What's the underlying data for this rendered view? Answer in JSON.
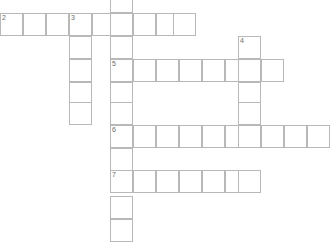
{
  "puzzle": {
    "title": "Crossword Grid",
    "cell_size": 23,
    "grid_columns": 14,
    "grid_rows": 11,
    "line_color": "#b8b8b8",
    "cell_color": "#ffffff",
    "number_color": "#6b6b6b",
    "background_color": "#ffffff"
  },
  "numbers_visible": [
    "2",
    "3",
    "4",
    "5",
    "6",
    "7"
  ],
  "cells": [
    {
      "id": "c-r0-c5",
      "x": 110,
      "y": -10,
      "number": "",
      "letter": ""
    },
    {
      "id": "c-r1-c0",
      "x": 0,
      "y": 13,
      "number": "2",
      "letter": ""
    },
    {
      "id": "c-r1-c1",
      "x": 23,
      "y": 13,
      "number": "",
      "letter": ""
    },
    {
      "id": "c-r1-c2",
      "x": 46,
      "y": 13,
      "number": "",
      "letter": ""
    },
    {
      "id": "c-r1-c3",
      "x": 69,
      "y": 13,
      "number": "3",
      "letter": ""
    },
    {
      "id": "c-r1-c4",
      "x": 92,
      "y": 13,
      "number": "",
      "letter": ""
    },
    {
      "id": "c-r1-c5",
      "x": 110,
      "y": 13,
      "number": "",
      "letter": ""
    },
    {
      "id": "c-r1-c6",
      "x": 133,
      "y": 13,
      "number": "",
      "letter": ""
    },
    {
      "id": "c-r1-c7",
      "x": 156,
      "y": 13,
      "number": "",
      "letter": ""
    },
    {
      "id": "c-r1-c8",
      "x": 173,
      "y": 13,
      "number": "",
      "letter": ""
    },
    {
      "id": "c-r2-c3",
      "x": 69,
      "y": 36,
      "number": "",
      "letter": ""
    },
    {
      "id": "c-r2-c5",
      "x": 110,
      "y": 36,
      "number": "",
      "letter": ""
    },
    {
      "id": "c-r2-c10",
      "x": 238,
      "y": 36,
      "number": "4",
      "letter": ""
    },
    {
      "id": "c-r3-c3",
      "x": 69,
      "y": 59,
      "number": "",
      "letter": ""
    },
    {
      "id": "c-r3-c5",
      "x": 110,
      "y": 59,
      "number": "5",
      "letter": ""
    },
    {
      "id": "c-r3-c6",
      "x": 133,
      "y": 59,
      "number": "",
      "letter": ""
    },
    {
      "id": "c-r3-c7",
      "x": 156,
      "y": 59,
      "number": "",
      "letter": ""
    },
    {
      "id": "c-r3-c8",
      "x": 179,
      "y": 59,
      "number": "",
      "letter": ""
    },
    {
      "id": "c-r3-c9",
      "x": 202,
      "y": 59,
      "number": "",
      "letter": ""
    },
    {
      "id": "c-r3-c10",
      "x": 225,
      "y": 59,
      "number": "",
      "letter": ""
    },
    {
      "id": "c-r3-c11",
      "x": 238,
      "y": 59,
      "number": "",
      "letter": ""
    },
    {
      "id": "c-r3-c12",
      "x": 261,
      "y": 59,
      "number": "",
      "letter": ""
    },
    {
      "id": "c-r4-c3",
      "x": 69,
      "y": 82,
      "number": "",
      "letter": ""
    },
    {
      "id": "c-r4-c5",
      "x": 110,
      "y": 82,
      "number": "",
      "letter": ""
    },
    {
      "id": "c-r4-c10",
      "x": 238,
      "y": 82,
      "number": "",
      "letter": ""
    },
    {
      "id": "c-r5-c3",
      "x": 69,
      "y": 102,
      "number": "",
      "letter": ""
    },
    {
      "id": "c-r5-c5",
      "x": 110,
      "y": 102,
      "number": "",
      "letter": ""
    },
    {
      "id": "c-r5-c10",
      "x": 238,
      "y": 102,
      "number": "",
      "letter": ""
    },
    {
      "id": "c-r6-c5",
      "x": 110,
      "y": 125,
      "number": "6",
      "letter": ""
    },
    {
      "id": "c-r6-c6",
      "x": 133,
      "y": 125,
      "number": "",
      "letter": ""
    },
    {
      "id": "c-r6-c7",
      "x": 156,
      "y": 125,
      "number": "",
      "letter": ""
    },
    {
      "id": "c-r6-c8",
      "x": 179,
      "y": 125,
      "number": "",
      "letter": ""
    },
    {
      "id": "c-r6-c9",
      "x": 202,
      "y": 125,
      "number": "",
      "letter": ""
    },
    {
      "id": "c-r6-c10",
      "x": 225,
      "y": 125,
      "number": "",
      "letter": ""
    },
    {
      "id": "c-r6-c11",
      "x": 238,
      "y": 125,
      "number": "",
      "letter": ""
    },
    {
      "id": "c-r6-c12",
      "x": 261,
      "y": 125,
      "number": "",
      "letter": ""
    },
    {
      "id": "c-r6-c13",
      "x": 284,
      "y": 125,
      "number": "",
      "letter": ""
    },
    {
      "id": "c-r6-c14",
      "x": 307,
      "y": 125,
      "number": "",
      "letter": ""
    },
    {
      "id": "c-r7-c5",
      "x": 110,
      "y": 148,
      "number": "",
      "letter": ""
    },
    {
      "id": "c-r8-c5",
      "x": 110,
      "y": 170,
      "number": "7",
      "letter": ""
    },
    {
      "id": "c-r8-c6",
      "x": 133,
      "y": 170,
      "number": "",
      "letter": ""
    },
    {
      "id": "c-r8-c7",
      "x": 156,
      "y": 170,
      "number": "",
      "letter": ""
    },
    {
      "id": "c-r8-c8",
      "x": 179,
      "y": 170,
      "number": "",
      "letter": ""
    },
    {
      "id": "c-r8-c9",
      "x": 202,
      "y": 170,
      "number": "",
      "letter": ""
    },
    {
      "id": "c-r8-c10",
      "x": 225,
      "y": 170,
      "number": "",
      "letter": ""
    },
    {
      "id": "c-r8-c11",
      "x": 238,
      "y": 170,
      "number": "",
      "letter": ""
    },
    {
      "id": "c-r9-c5",
      "x": 110,
      "y": 196,
      "number": "",
      "letter": ""
    },
    {
      "id": "c-r10-c5",
      "x": 110,
      "y": 219,
      "number": "",
      "letter": ""
    }
  ]
}
